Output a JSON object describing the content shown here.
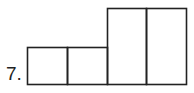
{
  "problem": {
    "number_label": "7.",
    "figure": {
      "description": "Composite shape of 4 rectangles: two short squares on the left, two tall rectangles on the right",
      "short_box_count": 2,
      "tall_box_count": 2,
      "stroke_color": "#222222"
    }
  }
}
